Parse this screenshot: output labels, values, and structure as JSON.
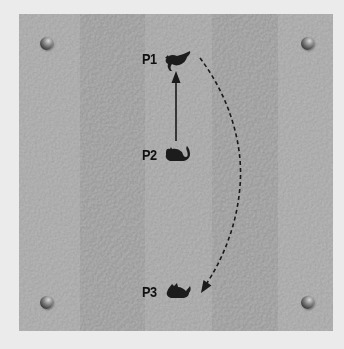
{
  "diagram": {
    "background_color": "#ebebeb",
    "board": {
      "base_color": "#a3a3a3",
      "stripes": [
        {
          "x": 0,
          "width": 61,
          "color": "#a8a8a8"
        },
        {
          "x": 61,
          "width": 65,
          "color": "#9b9b9b"
        },
        {
          "x": 126,
          "width": 67,
          "color": "#a6a6a6"
        },
        {
          "x": 193,
          "width": 66,
          "color": "#9b9b9b"
        },
        {
          "x": 259,
          "width": 55,
          "color": "#a8a8a8"
        }
      ]
    },
    "corner_markers": [
      {
        "name": "sphere-top-left",
        "x": 46,
        "y": 43
      },
      {
        "name": "sphere-top-right",
        "x": 307,
        "y": 43
      },
      {
        "name": "sphere-bottom-left",
        "x": 46,
        "y": 302
      },
      {
        "name": "sphere-bottom-right",
        "x": 307,
        "y": 302
      }
    ],
    "positions": [
      {
        "id": "P1",
        "label": "P1",
        "pose": "pouncing cat",
        "label_x": 142,
        "label_y": 52
      },
      {
        "id": "P2",
        "label": "P2",
        "pose": "crouching cat",
        "label_x": 142,
        "label_y": 148
      },
      {
        "id": "P3",
        "label": "P3",
        "pose": "sitting cat",
        "label_x": 142,
        "label_y": 285
      }
    ],
    "arrows": [
      {
        "from": "P2",
        "to": "P1",
        "style": "solid",
        "color": "#1a1a1a"
      },
      {
        "from": "P1",
        "to": "P3",
        "style": "dashed",
        "color": "#1a1a1a"
      }
    ]
  }
}
